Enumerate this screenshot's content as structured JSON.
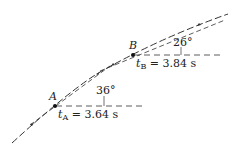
{
  "diagram": {
    "points": {
      "A": {
        "label": "A",
        "time_var": "t",
        "time_sub": "A",
        "time_text": " = 3.64 s",
        "angle": "36°"
      },
      "B": {
        "label": "B",
        "time_var": "t",
        "time_sub": "B",
        "time_text": " = 3.84 s",
        "angle": "26°"
      }
    },
    "colors": {
      "line": "#333333",
      "text": "#222222"
    }
  }
}
